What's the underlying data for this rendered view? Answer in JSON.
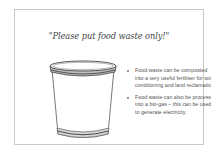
{
  "slide": {
    "title": "\"Please put food waste only!\"",
    "image": {
      "icon": "bucket-icon",
      "description": "empty food waste bucket"
    },
    "bullets": [
      {
        "text": "Food waste can be composted into a very useful fertiliser for soil conditioning and land reclamation."
      },
      {
        "text": "Food waste can also be processed into a bio-gas – this can be used to generate electricity."
      }
    ]
  },
  "colors": {
    "border": "#c9c9c9",
    "title_text": "#444444",
    "body_text": "#555555",
    "bucket_outline": "#555555"
  }
}
